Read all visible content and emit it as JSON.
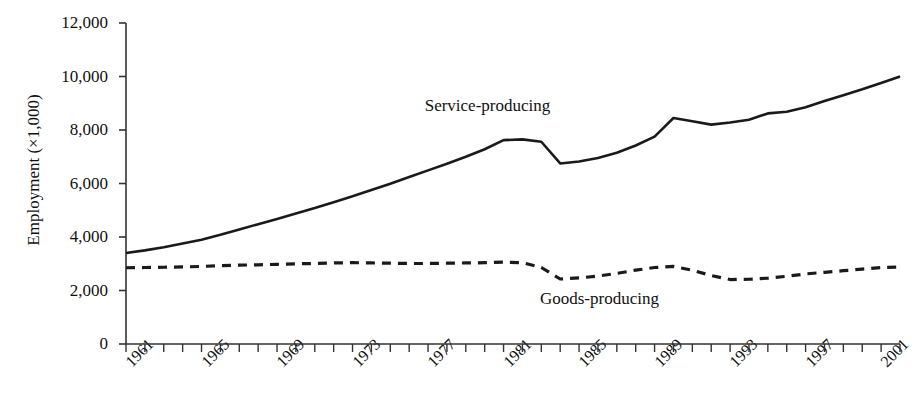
{
  "figure": {
    "title_clipped": "",
    "note": ""
  },
  "axes": {
    "ylabel": "Employment (×1,000)",
    "xlabel": "",
    "y_ticks": [
      "12,000",
      "10,000",
      "8,000",
      "6,000",
      "4,000",
      "2,000",
      "0"
    ],
    "x_ticks": [
      "1961",
      "1965",
      "1969",
      "1973",
      "1977",
      "1981",
      "1985",
      "1989",
      "1993",
      "1997",
      "2001"
    ]
  },
  "series_labels": {
    "service": "Service-producing",
    "goods": "Goods-producing"
  },
  "chart_data": {
    "type": "line",
    "title": "",
    "xlabel": "",
    "ylabel": "Employment (×1,000)",
    "xlim": [
      1961,
      2002
    ],
    "ylim": [
      0,
      12000
    ],
    "y_ticks": [
      0,
      2000,
      4000,
      6000,
      8000,
      10000,
      12000
    ],
    "x_tick_labels": [
      1961,
      1965,
      1969,
      1973,
      1977,
      1981,
      1985,
      1989,
      1993,
      1997,
      2001
    ],
    "x_minor_tick_interval": 1,
    "grid": false,
    "legend": "inline-annotations",
    "x": [
      1961,
      1962,
      1963,
      1964,
      1965,
      1966,
      1967,
      1968,
      1969,
      1970,
      1971,
      1972,
      1973,
      1974,
      1975,
      1976,
      1977,
      1978,
      1979,
      1980,
      1981,
      1982,
      1983,
      1984,
      1985,
      1986,
      1987,
      1988,
      1989,
      1990,
      1991,
      1992,
      1993,
      1994,
      1995,
      1996,
      1997,
      1998,
      1999,
      2000,
      2001,
      2002
    ],
    "series": [
      {
        "name": "Service-producing",
        "style": "solid",
        "color": "#1a1a1a",
        "values": [
          3400,
          3500,
          3620,
          3760,
          3900,
          4080,
          4280,
          4480,
          4670,
          4880,
          5080,
          5300,
          5520,
          5760,
          5990,
          6240,
          6490,
          6740,
          7000,
          7280,
          7620,
          7650,
          7560,
          6750,
          6820,
          6950,
          7150,
          7420,
          7750,
          8450,
          8330,
          8200,
          8280,
          8380,
          8620,
          8680,
          8850,
          9080,
          9300,
          9520,
          9760,
          10000
        ]
      },
      {
        "name": "Goods-producing",
        "style": "dashed",
        "color": "#1a1a1a",
        "values": [
          2850,
          2860,
          2870,
          2880,
          2900,
          2930,
          2950,
          2960,
          2980,
          3000,
          3010,
          3030,
          3040,
          3030,
          3020,
          3010,
          3010,
          3020,
          3030,
          3040,
          3060,
          3040,
          2860,
          2430,
          2470,
          2540,
          2640,
          2760,
          2860,
          2900,
          2760,
          2560,
          2410,
          2420,
          2460,
          2530,
          2620,
          2680,
          2740,
          2800,
          2860,
          2880
        ]
      }
    ],
    "annotations": [
      {
        "text": "Service-producing",
        "x": 1980,
        "y": 8900
      },
      {
        "text": "Goods-producing",
        "x": 1986,
        "y": 1700
      }
    ]
  }
}
